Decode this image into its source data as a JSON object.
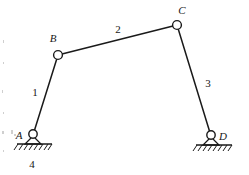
{
  "figure": {
    "kind": "four-bar-linkage-diagram",
    "background_color": "#ffffff",
    "ink_color": "#1a1a1a",
    "joints": [
      {
        "id": "A",
        "label": "A",
        "x": 33,
        "y": 135,
        "type": "ground-pin-support",
        "label_x": 19,
        "label_y": 136
      },
      {
        "id": "B",
        "label": "B",
        "x": 58,
        "y": 55,
        "type": "revolute-pin",
        "label_x": 52,
        "label_y": 42
      },
      {
        "id": "C",
        "label": "C",
        "x": 177,
        "y": 25,
        "type": "revolute-pin",
        "label_x": 181,
        "label_y": 14
      },
      {
        "id": "D",
        "label": "D",
        "x": 211,
        "y": 136,
        "type": "ground-pin-support",
        "label_x": 221,
        "label_y": 138
      }
    ],
    "links": [
      {
        "id": "1",
        "label": "1",
        "from": "A",
        "to": "B",
        "label_x": 35,
        "label_y": 93
      },
      {
        "id": "2",
        "label": "2",
        "from": "B",
        "to": "C",
        "label_x": 118,
        "label_y": 32
      },
      {
        "id": "3",
        "label": "3",
        "from": "C",
        "to": "D",
        "label_x": 207,
        "label_y": 84
      },
      {
        "id": "4",
        "label": "4",
        "from": "A",
        "to": "D",
        "label_x": 31,
        "label_y": 167
      }
    ],
    "ground_supports": [
      {
        "id": "ground-A",
        "line_x1": 17,
        "line_x2": 52,
        "line_y": 144
      },
      {
        "id": "ground-D",
        "line_x1": 196,
        "line_x2": 232,
        "line_y": 144
      }
    ]
  }
}
